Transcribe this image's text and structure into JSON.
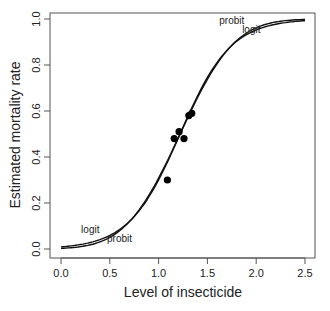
{
  "chart_data": {
    "type": "line",
    "title": "",
    "xlabel": "Level of insecticide",
    "ylabel": "Estimated mortality rate",
    "xlim": [
      0,
      2.5
    ],
    "ylim": [
      0,
      1
    ],
    "xticks": [
      "0.0",
      "0.5",
      "1.0",
      "1.5",
      "2.0",
      "2.5"
    ],
    "yticks": [
      "0.0",
      "0.2",
      "0.4",
      "0.6",
      "0.8",
      "1.0"
    ],
    "grid": false,
    "legend": "none",
    "series": [
      {
        "name": "logit",
        "type": "line",
        "model": "logistic",
        "midpoint": 1.22,
        "scale": 0.26
      },
      {
        "name": "probit",
        "type": "line",
        "model": "normal-cdf",
        "midpoint": 1.22,
        "scale": 0.44
      }
    ],
    "points": {
      "type": "scatter",
      "x": [
        1.09,
        1.16,
        1.21,
        1.26,
        1.31,
        1.34
      ],
      "y": [
        0.3,
        0.48,
        0.51,
        0.48,
        0.58,
        0.59
      ]
    },
    "annotations": [
      {
        "text": "logit",
        "x": 0.3,
        "y": 0.07
      },
      {
        "text": "probit",
        "x": 0.6,
        "y": 0.03
      },
      {
        "text": "probit",
        "x": 1.75,
        "y": 0.98
      },
      {
        "text": "logit",
        "x": 1.95,
        "y": 0.94
      }
    ]
  }
}
